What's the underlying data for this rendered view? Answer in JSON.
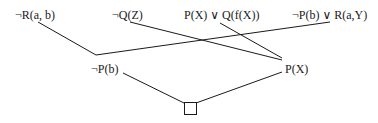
{
  "diagram": {
    "type": "resolution-refutation-tree",
    "colors": {
      "ink": "#1a1a1a",
      "background": "#ffffff"
    },
    "clauses": {
      "top": [
        {
          "id": "c1",
          "label": "¬R(a, b)",
          "x": 15,
          "y": 8
        },
        {
          "id": "c2",
          "label": "¬Q(Z)",
          "x": 112,
          "y": 8
        },
        {
          "id": "c3",
          "label": "P(X) ∨ Q(f(X))",
          "x": 184,
          "y": 8
        },
        {
          "id": "c4",
          "label": "¬P(b) ∨ R(a,Y)",
          "x": 292,
          "y": 8
        }
      ],
      "middle": [
        {
          "id": "r1",
          "label": "¬P(b)",
          "x": 91,
          "y": 62
        },
        {
          "id": "r2",
          "label": "P(X)",
          "x": 285,
          "y": 62
        }
      ],
      "bottom": {
        "id": "empty",
        "label": "□",
        "meaning": "empty clause"
      }
    },
    "edges": [
      {
        "from": "c1",
        "to": "r1"
      },
      {
        "from": "c4",
        "to": "r1"
      },
      {
        "from": "c2",
        "to": "r2"
      },
      {
        "from": "c3",
        "to": "r2"
      },
      {
        "from": "r1",
        "to": "empty"
      },
      {
        "from": "r2",
        "to": "empty"
      }
    ]
  }
}
